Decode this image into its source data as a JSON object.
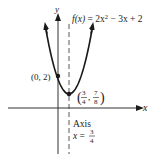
{
  "diagram": {
    "type": "function-graph",
    "function_label": "f(x) = 2x² − 3x + 2",
    "function_label_parts": {
      "fx": "f(x)",
      "eq": " = 2x",
      "sup": "2",
      "rest": " − 3x + 2"
    },
    "axes": {
      "x_label": "x",
      "y_label": "y"
    },
    "points": [
      {
        "name": "y-intercept",
        "label": "(0, 2)",
        "x": 0,
        "y": 2
      },
      {
        "name": "vertex",
        "label": "(3/4, 7/8)",
        "x": 0.75,
        "y": 0.875,
        "frac_x": {
          "num": "3",
          "den": "4"
        },
        "frac_y": {
          "num": "7",
          "den": "8"
        }
      }
    ],
    "axis_of_symmetry": {
      "title": "Axis",
      "eq_prefix": "x =",
      "frac": {
        "num": "3",
        "den": "4"
      },
      "value": 0.75
    },
    "colors": {
      "curve": "#1a1a1a",
      "axes": "#333333",
      "text": "#222222",
      "background": "#ffffff"
    }
  }
}
